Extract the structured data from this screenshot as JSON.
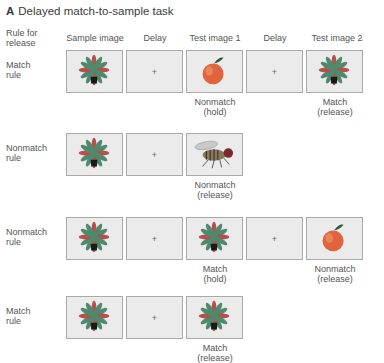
{
  "title": {
    "letter": "A",
    "text": "Delayed match-to-sample task"
  },
  "rule_header": [
    "Rule for",
    "release"
  ],
  "column_headers": [
    "Sample image",
    "Delay",
    "Test image 1",
    "Delay",
    "Test image 2"
  ],
  "fixation_symbol": "+",
  "rows": [
    {
      "rule": [
        "Match",
        "rule"
      ],
      "cells": [
        "plant-image",
        "fixation-cross",
        "apple-image",
        "fixation-cross",
        "plant-image"
      ],
      "captions": [
        {
          "column": 2,
          "lines": [
            "Nonmatch",
            "(hold)"
          ]
        },
        {
          "column": 4,
          "lines": [
            "Match",
            "(release)"
          ]
        }
      ]
    },
    {
      "rule": [
        "Nonmatch",
        "rule"
      ],
      "cells": [
        "plant-image",
        "fixation-cross",
        "fly-image"
      ],
      "captions": [
        {
          "column": 2,
          "lines": [
            "Nonmatch",
            "(release)"
          ]
        }
      ]
    },
    {
      "rule": [
        "Nonmatch",
        "rule"
      ],
      "cells": [
        "plant-image",
        "fixation-cross",
        "plant-image",
        "fixation-cross",
        "apple-image"
      ],
      "captions": [
        {
          "column": 2,
          "lines": [
            "Match",
            "(hold)"
          ]
        },
        {
          "column": 4,
          "lines": [
            "Nonmatch",
            "(release)"
          ]
        }
      ]
    },
    {
      "rule": [
        "Match",
        "rule"
      ],
      "cells": [
        "plant-image",
        "fixation-cross",
        "plant-image"
      ],
      "captions": [
        {
          "column": 2,
          "lines": [
            "Match",
            "(release)"
          ]
        }
      ]
    }
  ],
  "colors": {
    "box_fill": "#ebebeb",
    "box_border": "#a9a9a9",
    "plant_leaf": "#4f8a6e",
    "plant_leaf_red": "#b5504a",
    "pot": "#1a1a1a",
    "apple": "#e0643c",
    "apple_leaf": "#2f5a3a"
  }
}
